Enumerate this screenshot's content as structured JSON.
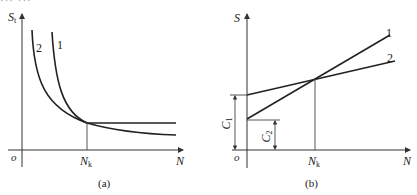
{
  "cut_off_header": "··· ···",
  "panels": [
    {
      "id": "a",
      "caption": "(a)",
      "y_axis": {
        "symbol": "S",
        "subscript": "t"
      },
      "x_axis": {
        "symbol": "N"
      },
      "origin": "o",
      "marker": {
        "symbol": "N",
        "subscript": "k"
      },
      "curves": [
        {
          "label": "1",
          "description": "steep decay, then flat beyond N_k"
        },
        {
          "label": "2",
          "description": "gradual hyperbolic decay"
        }
      ]
    },
    {
      "id": "b",
      "caption": "(b)",
      "y_axis": {
        "symbol": "S"
      },
      "x_axis": {
        "symbol": "N"
      },
      "origin": "o",
      "marker": {
        "symbol": "N",
        "subscript": "k"
      },
      "intercepts": [
        {
          "symbol": "C",
          "subscript": "1"
        },
        {
          "symbol": "C",
          "subscript": "2"
        }
      ],
      "lines": [
        {
          "label": "1",
          "description": "intercept C2, steeper slope"
        },
        {
          "label": "2",
          "description": "intercept C1, shallower slope"
        }
      ]
    }
  ],
  "colors": {
    "line": "#222222",
    "axis": "#333333",
    "background": "#ffffff"
  }
}
